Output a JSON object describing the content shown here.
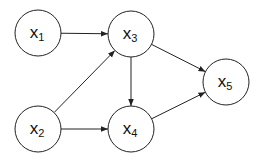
{
  "diagram": {
    "type": "directed-acyclic-graph",
    "nodes": [
      {
        "id": "x1",
        "base": "X",
        "sub": "1",
        "cx": 38,
        "cy": 33,
        "r": 23
      },
      {
        "id": "x2",
        "base": "X",
        "sub": "2",
        "cx": 38,
        "cy": 129,
        "r": 23
      },
      {
        "id": "x3",
        "base": "X",
        "sub": "3",
        "cx": 131,
        "cy": 34,
        "r": 23
      },
      {
        "id": "x4",
        "base": "X",
        "sub": "4",
        "cx": 131,
        "cy": 129,
        "r": 23
      },
      {
        "id": "x5",
        "base": "X",
        "sub": "5",
        "cx": 226,
        "cy": 82,
        "r": 23
      }
    ],
    "edges": [
      {
        "from": "x1",
        "to": "x3"
      },
      {
        "from": "x2",
        "to": "x3"
      },
      {
        "from": "x2",
        "to": "x4"
      },
      {
        "from": "x3",
        "to": "x4"
      },
      {
        "from": "x3",
        "to": "x5"
      },
      {
        "from": "x4",
        "to": "x5"
      }
    ],
    "colors": {
      "stroke": "#222222",
      "background": "#ffffff",
      "text": "#111111"
    }
  }
}
